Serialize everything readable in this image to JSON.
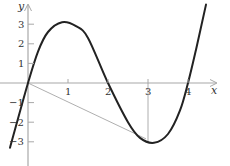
{
  "chart_data": {
    "type": "line",
    "title": "",
    "xlabel": "x",
    "ylabel": "y",
    "xlim": [
      -0.5,
      4.6
    ],
    "ylim": [
      -3.8,
      4.1
    ],
    "grid": false,
    "legend": null,
    "x_ticks": [
      1,
      2,
      3,
      4
    ],
    "x_tick_labels": [
      "1",
      "2",
      "3",
      "4"
    ],
    "y_ticks": [
      -3,
      -2,
      -1,
      1,
      2,
      3
    ],
    "y_tick_labels": [
      "−3",
      "−2",
      "−1",
      "1",
      "2",
      "3"
    ],
    "series": [
      {
        "name": "curve",
        "style": "solid-thick",
        "function": "cubic with roots at x=0, 2, 4; local max near (0.85, 3.1); local min near (3.15, -3.05)",
        "x": [
          -0.45,
          0,
          0.25,
          0.5,
          0.85,
          1.2,
          1.5,
          2,
          2.5,
          2.8,
          3.15,
          3.5,
          3.8,
          4,
          4.2,
          4.45
        ],
        "y": [
          -3.3,
          0,
          1.6,
          2.6,
          3.1,
          2.9,
          2.3,
          0,
          -2.0,
          -2.8,
          -3.05,
          -2.6,
          -1.4,
          0,
          1.7,
          4.0
        ]
      },
      {
        "name": "secant-line",
        "style": "thin-gray",
        "x": [
          0,
          2.95
        ],
        "y": [
          0,
          -2.85
        ]
      },
      {
        "name": "vertical-guide-x3",
        "style": "thin-gray",
        "x": [
          3,
          3
        ],
        "y": [
          0,
          -3.0
        ]
      }
    ]
  },
  "labels": {
    "x_axis": "x",
    "y_axis": "y"
  }
}
